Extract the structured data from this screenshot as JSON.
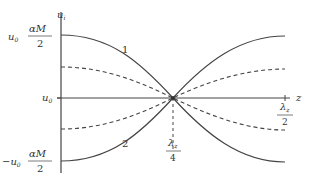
{
  "diagram": {
    "axes": {
      "y_label": "u",
      "y_label_sub": "i",
      "x_label": "z"
    },
    "y_ticks": {
      "top": {
        "prefix": "u",
        "prefix_sub": "0",
        "num": "αM",
        "den": "2"
      },
      "mid": {
        "prefix": "u",
        "prefix_sub": "0"
      },
      "bottom": {
        "prefix": "−u",
        "prefix_sub": "0",
        "num": "αM",
        "den": "2"
      }
    },
    "x_ticks": {
      "quarter": {
        "num": "λ",
        "num_sub": "z",
        "den": "4"
      },
      "half": {
        "num": "λ",
        "num_sub": "z",
        "den": "2"
      }
    },
    "curve_labels": {
      "curve1": "1",
      "curve2": "2"
    },
    "colors": {
      "line": "#444444",
      "text": "#333333"
    }
  }
}
